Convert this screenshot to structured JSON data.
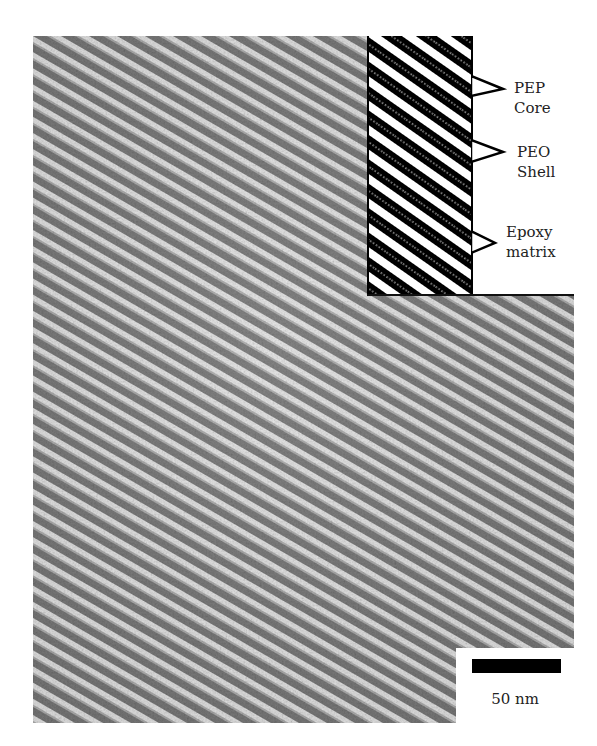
{
  "figure": {
    "inset": {
      "labels": [
        {
          "id": "pep",
          "line1": "PEP",
          "line2": "Core"
        },
        {
          "id": "peo",
          "line1": "PEO",
          "line2": "Shell"
        },
        {
          "id": "epoxy",
          "line1": "Epoxy",
          "line2": "matrix"
        }
      ]
    },
    "scale_bar": {
      "label": "50 nm"
    },
    "colors": {
      "stripe_light": "#e8e8e8",
      "stripe_dark": "#6e6e6e",
      "inset_black": "#000000",
      "inset_white": "#ffffff"
    }
  }
}
